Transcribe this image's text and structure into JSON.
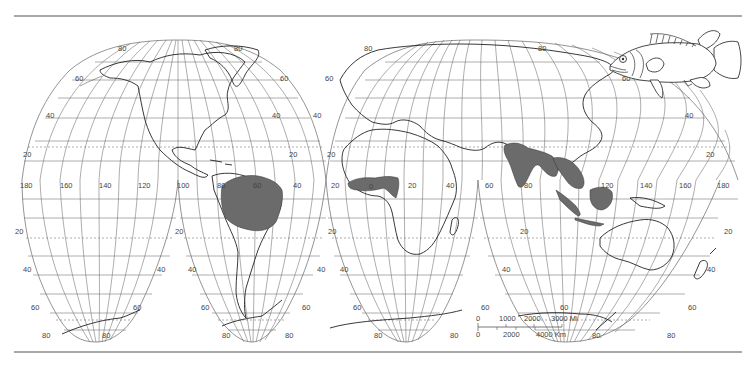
{
  "map": {
    "projection": "interrupted homolosine",
    "range_fill_color": "#6b6b6b",
    "line_color": "#555555",
    "meridian_labels_equator": [
      {
        "text": "180",
        "x": 20,
        "y": 188
      },
      {
        "text": "160",
        "x": 60,
        "y": 188
      },
      {
        "text": "140",
        "x": 99,
        "y": 188
      },
      {
        "text": "120",
        "x": 138,
        "y": 188
      },
      {
        "text": "100",
        "x": 177,
        "y": 188
      },
      {
        "text": "80",
        "x": 217,
        "y": 188
      },
      {
        "text": "60",
        "x": 253,
        "y": 188
      },
      {
        "text": "40",
        "x": 293,
        "y": 188
      },
      {
        "text": "20",
        "x": 331,
        "y": 188
      },
      {
        "text": "0",
        "x": 369,
        "y": 189
      },
      {
        "text": "20",
        "x": 408,
        "y": 188
      },
      {
        "text": "40",
        "x": 446,
        "y": 188
      },
      {
        "text": "60",
        "x": 485,
        "y": 188
      },
      {
        "text": "80",
        "x": 524,
        "y": 188
      },
      {
        "text": "120",
        "x": 601,
        "y": 188
      },
      {
        "text": "140",
        "x": 640,
        "y": 188
      },
      {
        "text": "160",
        "x": 679,
        "y": 188
      },
      {
        "text": "180",
        "x": 717,
        "y": 188
      }
    ],
    "latitude_labels": [
      {
        "text": "80",
        "x": 118,
        "y": 51
      },
      {
        "text": "80",
        "x": 234,
        "y": 51
      },
      {
        "text": "80",
        "x": 364,
        "y": 51
      },
      {
        "text": "80",
        "x": 538,
        "y": 51
      },
      {
        "text": "60",
        "x": 75,
        "y": 81
      },
      {
        "text": "60",
        "x": 280,
        "y": 81
      },
      {
        "text": "60",
        "x": 325,
        "y": 81
      },
      {
        "text": "60",
        "x": 622,
        "y": 81
      },
      {
        "text": "40",
        "x": 46,
        "y": 118
      },
      {
        "text": "40",
        "x": 272,
        "y": 118
      },
      {
        "text": "40",
        "x": 313,
        "y": 118
      },
      {
        "text": "40",
        "x": 685,
        "y": 118
      },
      {
        "text": "20",
        "x": 23,
        "y": 157
      },
      {
        "text": "20",
        "x": 289,
        "y": 157
      },
      {
        "text": "20",
        "x": 327,
        "y": 157
      },
      {
        "text": "20",
        "x": 706,
        "y": 157
      },
      {
        "text": "20",
        "x": 15,
        "y": 234
      },
      {
        "text": "20",
        "x": 175,
        "y": 234
      },
      {
        "text": "20",
        "x": 328,
        "y": 234
      },
      {
        "text": "20",
        "x": 520,
        "y": 234
      },
      {
        "text": "20",
        "x": 724,
        "y": 234
      },
      {
        "text": "40",
        "x": 23,
        "y": 272
      },
      {
        "text": "40",
        "x": 157,
        "y": 272
      },
      {
        "text": "40",
        "x": 188,
        "y": 272
      },
      {
        "text": "40",
        "x": 317,
        "y": 272
      },
      {
        "text": "40",
        "x": 340,
        "y": 272
      },
      {
        "text": "40",
        "x": 502,
        "y": 272
      },
      {
        "text": "40",
        "x": 707,
        "y": 272
      },
      {
        "text": "60",
        "x": 31,
        "y": 310
      },
      {
        "text": "60",
        "x": 133,
        "y": 310
      },
      {
        "text": "60",
        "x": 201,
        "y": 310
      },
      {
        "text": "60",
        "x": 302,
        "y": 310
      },
      {
        "text": "60",
        "x": 353,
        "y": 310
      },
      {
        "text": "60",
        "x": 481,
        "y": 310
      },
      {
        "text": "60",
        "x": 560,
        "y": 310
      },
      {
        "text": "60",
        "x": 688,
        "y": 310
      },
      {
        "text": "80",
        "x": 42,
        "y": 338
      },
      {
        "text": "80",
        "x": 102,
        "y": 338
      },
      {
        "text": "80",
        "x": 222,
        "y": 338
      },
      {
        "text": "80",
        "x": 285,
        "y": 338
      },
      {
        "text": "80",
        "x": 374,
        "y": 338
      },
      {
        "text": "80",
        "x": 450,
        "y": 338
      },
      {
        "text": "80",
        "x": 592,
        "y": 338
      },
      {
        "text": "80",
        "x": 667,
        "y": 338
      }
    ]
  },
  "scale_bar": {
    "miles_label_0": "0",
    "miles_label_1000": "1000",
    "miles_label_2000": "2000",
    "miles_label_3000": "3000 Mi",
    "km_label_0": "0",
    "km_label_2000": "2000",
    "km_label_4000": "4000 Km"
  },
  "distribution_regions": [
    "Amazon basin (South America)",
    "West Africa (Niger basin)",
    "Indian subcontinent",
    "Southeast Asia",
    "Sumatra",
    "Borneo"
  ],
  "illustration": "fish"
}
